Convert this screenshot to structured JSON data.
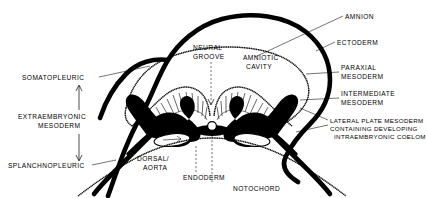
{
  "figure": {
    "background_color": "#ffffff",
    "ink_color": "#000000",
    "width": 427,
    "height": 198
  },
  "labels": {
    "amnion": "AMNION",
    "ectoderm": "ECTODERM",
    "paraxial_mesoderm_line1": "PARAXIAL",
    "paraxial_mesoderm_line2": "MESODERM",
    "intermediate_mesoderm_line1": "INTERMEDIATE",
    "intermediate_mesoderm_line2": "MESODERM",
    "lateral_plate_line1": "LATERAL PLATE MESODERM",
    "lateral_plate_line2": "CONTAINING DEVELOPING",
    "lateral_plate_line3": "INTRAEMBRYONIC COELOM",
    "neural_groove_line1": "NEURAL",
    "neural_groove_line2": "GROOVE",
    "amniotic_cavity_line1": "AMNIOTIC",
    "amniotic_cavity_line2": "CAVITY",
    "somatopleuric": "SOMATOPLEURIC",
    "extraembryonic_line1": "EXTRAEMBRYONIC",
    "extraembryonic_line2": "MESODERM",
    "splanchnopleuric": "SPLANCHNOPLEURIC",
    "dorsal_aorta_line1": "DORSAL/",
    "dorsal_aorta_line2": "AORTA",
    "endoderm": "ENDODERM",
    "notochord": "NOTOCHORD"
  },
  "structures": {
    "chorion_somatopleure": "outer-thick-black-curve",
    "amnion_membrane": "inner-dotted-membrane",
    "neural_plate": "hatched-neural-folds",
    "somite_mass": "solid-black-paraxial-mesoderm",
    "notochord_ring": "small-white-circle",
    "coelom_cavity": "white-oval-cavity",
    "endoderm_layer": "dotted-lower-membrane",
    "splanchnopleure": "thick-black-lower-band"
  }
}
